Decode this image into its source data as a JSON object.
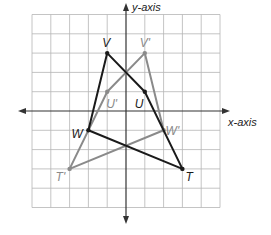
{
  "diagram": {
    "type": "coordinate-plane-transformation",
    "axes": {
      "x_label": "x-axis",
      "y_label": "y-axis"
    },
    "grid": {
      "x_min": -5,
      "x_max": 5,
      "y_min": -5,
      "y_max": 5,
      "step": 1
    },
    "colors": {
      "original": "#1a1a1a",
      "image": "#8a8a8a",
      "grid": "#b5b5b5",
      "axis": "#333333"
    },
    "original_figure": {
      "name": "VUTW",
      "vertices": [
        {
          "label": "V",
          "x": -1,
          "y": 3
        },
        {
          "label": "U",
          "x": 1,
          "y": 1
        },
        {
          "label": "T",
          "x": 3,
          "y": -3
        },
        {
          "label": "W",
          "x": -2,
          "y": -1
        }
      ]
    },
    "image_figure": {
      "name": "V'U'T'W'",
      "vertices": [
        {
          "label": "V'",
          "x": 1,
          "y": 3
        },
        {
          "label": "U'",
          "x": -1,
          "y": 1
        },
        {
          "label": "T'",
          "x": -3,
          "y": -3
        },
        {
          "label": "W'",
          "x": 2,
          "y": -1
        }
      ]
    }
  }
}
